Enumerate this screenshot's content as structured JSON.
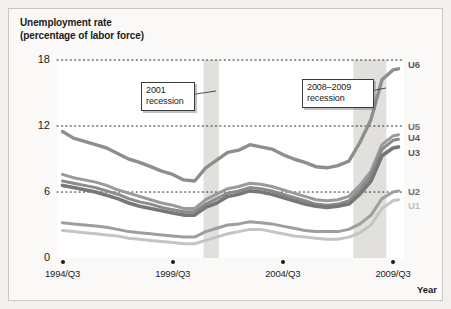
{
  "figure": {
    "title_line1": "Unemployment rate",
    "title_line2": "(percentage of labor force)",
    "background_color": "#f2f1ef",
    "plot_background_color": "#ffffff",
    "frame_border_color": "#c9c7c4"
  },
  "annotations": [
    {
      "name": "recession-2001",
      "line1": "2001",
      "line2": "recession"
    },
    {
      "name": "recession-2008-2009",
      "line1": "2008–2009",
      "line2": "recession"
    }
  ],
  "chart_data": {
    "type": "line",
    "title": "Unemployment rate (percentage of labor force)",
    "xlabel": "Year",
    "ylabel": "",
    "ylim": [
      0,
      18
    ],
    "yticks": [
      0,
      6,
      12,
      18
    ],
    "xlim": [
      1994.5,
      2010.25
    ],
    "xticks": [
      1994.75,
      1999.75,
      2004.75,
      2009.75
    ],
    "xticklabels": [
      "1994/Q3",
      "1999/Q3",
      "2004/Q3",
      "2009/Q3"
    ],
    "grid": "horizontal-dotted",
    "legend": "right-inline-labels",
    "shaded_bands": [
      {
        "label": "2001 recession",
        "x0": 2001.15,
        "x1": 2001.85,
        "color": "#e2e0dd"
      },
      {
        "label": "2008-2009 recession",
        "x0": 2007.95,
        "x1": 2009.45,
        "color": "#e2e0dd"
      }
    ],
    "x": [
      1994.75,
      1995.25,
      1995.75,
      1996.25,
      1996.75,
      1997.25,
      1997.75,
      1998.25,
      1998.75,
      1999.25,
      1999.75,
      2000.25,
      2000.75,
      2001.25,
      2001.75,
      2002.25,
      2002.75,
      2003.25,
      2003.75,
      2004.25,
      2004.75,
      2005.25,
      2005.75,
      2006.25,
      2006.75,
      2007.25,
      2007.75,
      2008.25,
      2008.75,
      2009.25,
      2009.75,
      2010.0
    ],
    "series": [
      {
        "name": "U6",
        "color": "#8e8e8e",
        "values": [
          11.5,
          10.9,
          10.6,
          10.3,
          10.0,
          9.5,
          9.0,
          8.7,
          8.3,
          7.9,
          7.6,
          7.1,
          7.0,
          8.2,
          8.9,
          9.6,
          9.8,
          10.3,
          10.1,
          9.9,
          9.4,
          9.0,
          8.7,
          8.3,
          8.2,
          8.4,
          8.8,
          10.5,
          12.6,
          16.2,
          17.1,
          17.2
        ]
      },
      {
        "name": "U5",
        "color": "#9a9a9a",
        "values": [
          7.6,
          7.3,
          7.1,
          6.9,
          6.6,
          6.2,
          5.9,
          5.6,
          5.3,
          5.0,
          4.8,
          4.5,
          4.5,
          5.3,
          5.8,
          6.3,
          6.5,
          6.8,
          6.7,
          6.5,
          6.2,
          5.9,
          5.6,
          5.3,
          5.2,
          5.3,
          5.6,
          6.6,
          7.9,
          10.3,
          11.1,
          11.2
        ]
      },
      {
        "name": "U4",
        "color": "#8a8a8a",
        "values": [
          7.0,
          6.8,
          6.6,
          6.4,
          6.1,
          5.8,
          5.4,
          5.1,
          4.9,
          4.6,
          4.4,
          4.2,
          4.2,
          4.9,
          5.4,
          5.9,
          6.1,
          6.4,
          6.3,
          6.1,
          5.8,
          5.5,
          5.2,
          4.9,
          4.8,
          4.9,
          5.2,
          6.2,
          7.5,
          9.9,
          10.7,
          10.8
        ]
      },
      {
        "name": "U3",
        "color": "#777777",
        "values": [
          6.6,
          6.4,
          6.2,
          6.0,
          5.7,
          5.4,
          5.0,
          4.7,
          4.5,
          4.3,
          4.1,
          3.9,
          3.9,
          4.6,
          5.0,
          5.6,
          5.8,
          6.1,
          6.0,
          5.8,
          5.5,
          5.2,
          4.9,
          4.7,
          4.6,
          4.7,
          4.9,
          5.8,
          7.0,
          9.3,
          10.0,
          10.1
        ]
      },
      {
        "name": "U2",
        "color": "#9e9e9e",
        "values": [
          3.2,
          3.1,
          3.0,
          2.9,
          2.8,
          2.6,
          2.4,
          2.3,
          2.2,
          2.1,
          2.0,
          1.9,
          1.9,
          2.4,
          2.7,
          3.0,
          3.1,
          3.3,
          3.2,
          3.1,
          2.9,
          2.7,
          2.5,
          2.4,
          2.4,
          2.4,
          2.6,
          3.1,
          3.9,
          5.4,
          6.0,
          6.1
        ]
      },
      {
        "name": "U1",
        "color": "#c4c4c4",
        "values": [
          2.5,
          2.4,
          2.3,
          2.2,
          2.1,
          2.0,
          1.8,
          1.7,
          1.6,
          1.5,
          1.4,
          1.3,
          1.3,
          1.6,
          1.9,
          2.2,
          2.4,
          2.6,
          2.6,
          2.4,
          2.2,
          2.0,
          1.9,
          1.8,
          1.7,
          1.7,
          1.9,
          2.3,
          3.0,
          4.5,
          5.2,
          5.3
        ]
      }
    ]
  }
}
